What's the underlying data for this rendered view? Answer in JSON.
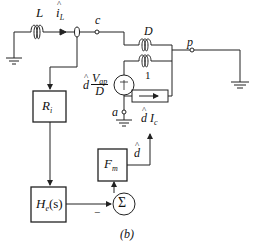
{
  "figure": {
    "caption": "(b)",
    "type": "averaged switch model with current-mode control loop"
  },
  "labels": {
    "inductor": "L",
    "inductor_current_base": "i",
    "inductor_current_sub": "L",
    "node_c": "c",
    "node_p": "p",
    "node_a": "a",
    "transformer_ratio_top": "D",
    "transformer_ratio_bottom": "1",
    "voltage_source_d": "d",
    "voltage_source_num": "V",
    "voltage_source_num_sub": "ap",
    "voltage_source_den": "D",
    "current_source_d": "d",
    "current_source_i": "I",
    "current_source_sub": "c",
    "feedback_d": "d",
    "sum_minus": "−",
    "sum_symbol": "Σ"
  },
  "blocks": {
    "sensor_gain": {
      "main": "R",
      "sub": "i"
    },
    "compensator": {
      "main": "H",
      "sub": "e",
      "suffix": "(s)"
    },
    "modulator": {
      "main": "F",
      "sub": "m"
    }
  },
  "colors": {
    "stroke": "#222222",
    "background": "#ffffff"
  }
}
